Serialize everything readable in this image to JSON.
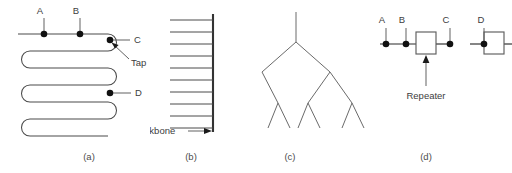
{
  "figure": {
    "background": "#ffffff",
    "line_color": "#4a4a4a",
    "node_color": "#111111",
    "text_color": "#3d3d3d"
  },
  "panels": [
    {
      "id": "a",
      "caption": "(a)",
      "topology": "serpentine-bus",
      "node_labels": [
        "A",
        "B",
        "C",
        "D"
      ],
      "annotations": [
        "Tap"
      ]
    },
    {
      "id": "b",
      "caption": "(b)",
      "topology": "backbone-with-drops",
      "node_labels": [],
      "annotations": [
        "Backbone"
      ],
      "branch_count": 10
    },
    {
      "id": "c",
      "caption": "(c)",
      "topology": "tree",
      "node_labels": [],
      "annotations": []
    },
    {
      "id": "d",
      "caption": "(d)",
      "topology": "bus-with-repeaters",
      "node_labels": [
        "A",
        "B",
        "C",
        "D"
      ],
      "annotations": [
        "Repeater"
      ],
      "repeater_count": 2
    }
  ],
  "panel_a": {
    "label_a": "A",
    "label_b": "B",
    "label_c": "C",
    "label_d": "D",
    "label_tap": "Tap",
    "caption": "(a)"
  },
  "panel_b": {
    "label_backbone": "Backbone",
    "caption": "(b)"
  },
  "panel_c": {
    "caption": "(c)"
  },
  "panel_d": {
    "label_a": "A",
    "label_b": "B",
    "label_c": "C",
    "label_d": "D",
    "label_repeater": "Repeater",
    "caption": "(d)"
  }
}
